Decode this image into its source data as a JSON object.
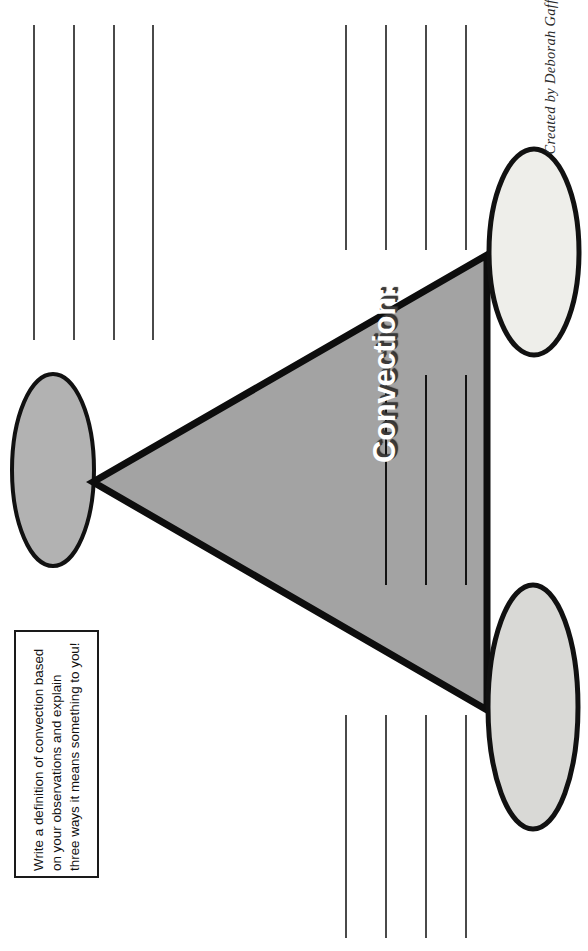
{
  "page": {
    "width": 588,
    "height": 951,
    "background": "#ffffff",
    "orientation": "landscape-rotated-90"
  },
  "credit": {
    "text": "Created by Deborah Gaff"
  },
  "diagram": {
    "title_label": "Convection:",
    "shape": "triangle-with-three-ellipse-nodes",
    "triangle": {
      "fill": "#a3a3a3",
      "stroke": "#0d0d0d",
      "stroke_width": 7,
      "vertices": [
        [
          93,
          482
        ],
        [
          487,
          255
        ],
        [
          487,
          710
        ]
      ]
    },
    "nodes": [
      {
        "name": "left-ellipse",
        "cx": 53,
        "cy": 470,
        "rx": 41,
        "ry": 96,
        "fill": "#b2b2b2",
        "stroke": "#111111"
      },
      {
        "name": "top-right-ellipse",
        "cx": 534,
        "cy": 252,
        "rx": 45,
        "ry": 103,
        "fill": "#eeeeea",
        "stroke": "#111111"
      },
      {
        "name": "bottom-right-ellipse",
        "cx": 533,
        "cy": 707,
        "rx": 45,
        "ry": 122,
        "fill": "#d9d9d6",
        "stroke": "#111111"
      }
    ]
  },
  "instruction_box": {
    "lines": [
      "Write a definition of convection based",
      "on  your  observations  and  explain",
      "three ways it means something to you!"
    ],
    "border_color": "#1a1a1a"
  },
  "writing_lines": {
    "groups": [
      {
        "name": "top-left-lines",
        "count": 4,
        "orientation": "vertical",
        "color": "#4a4a4a",
        "y_start": 25,
        "y_end": 340,
        "x_positions": [
          33,
          73,
          113,
          152
        ]
      },
      {
        "name": "top-right-lines",
        "count": 4,
        "orientation": "vertical",
        "color": "#4a4a4a",
        "y_start": 25,
        "y_end": 250,
        "x_positions": [
          345,
          385,
          425,
          465
        ]
      },
      {
        "name": "triangle-inner-lines",
        "count": 3,
        "orientation": "vertical",
        "color": "#131313",
        "y_start": 375,
        "y_end": 585,
        "x_positions": [
          385,
          425,
          465
        ]
      },
      {
        "name": "bottom-right-lines",
        "count": 4,
        "orientation": "vertical",
        "color": "#4a4a4a",
        "y_start": 715,
        "y_end": 938,
        "x_positions": [
          345,
          385,
          425,
          465
        ]
      }
    ]
  }
}
